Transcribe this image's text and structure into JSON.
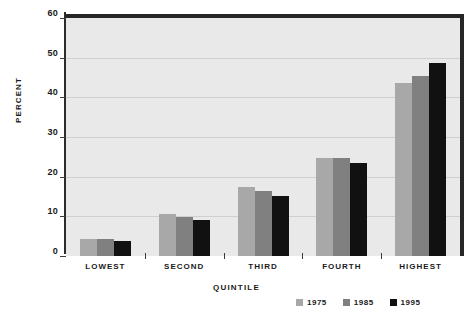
{
  "chart_data": {
    "type": "bar",
    "title": "",
    "xlabel": "QUINTILE",
    "ylabel": "PERCENT",
    "categories": [
      "LOWEST",
      "SECOND",
      "THIRD",
      "FOURTH",
      "HIGHEST"
    ],
    "series": [
      {
        "name": "1975",
        "color": "#a8a8a8",
        "values": [
          4.3,
          10.5,
          17.3,
          24.8,
          43.5
        ]
      },
      {
        "name": "1985",
        "color": "#808080",
        "values": [
          4.3,
          9.8,
          16.5,
          24.8,
          45.5
        ]
      },
      {
        "name": "1995",
        "color": "#111111",
        "values": [
          3.7,
          9.2,
          15.2,
          23.5,
          48.7
        ]
      }
    ],
    "ylim": [
      0,
      60
    ],
    "yticks": [
      0,
      10,
      20,
      30,
      40,
      50,
      60
    ],
    "ytick_labels": [
      "0",
      "10",
      "20",
      "30",
      "40",
      "50",
      "60"
    ],
    "grid": true,
    "grid_axis": "y",
    "legend_position": "bottom-right",
    "plot_background": "#e9e9e9"
  }
}
